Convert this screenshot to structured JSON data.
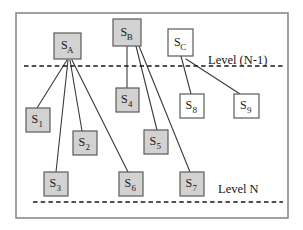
{
  "figure": {
    "title": "",
    "frame": {
      "x": 16,
      "y": 13,
      "width": 272,
      "height": 205,
      "border_color": "#8a8a8a"
    },
    "colors": {
      "filled_node_fill": "#d2d2d2",
      "open_node_fill": "#ffffff",
      "node_stroke": "#5a5a5a",
      "edge_color": "#3a3a3a",
      "level_line_color": "#1a1a1a",
      "text_color": "#1a1a1a"
    }
  },
  "level_lines": [
    {
      "id": "level-n-1-line",
      "y": 66,
      "x1": 24,
      "x2": 283,
      "style": "dashed"
    },
    {
      "id": "level-n-line",
      "y": 202,
      "x1": 33,
      "x2": 283,
      "style": "dashed"
    }
  ],
  "level_labels": [
    {
      "id": "level-n-1-label",
      "text": "Level (N-1)",
      "x": 208,
      "y": 64
    },
    {
      "id": "level-n-label",
      "text": "Level N",
      "x": 218,
      "y": 193
    }
  ],
  "nodes": [
    {
      "id": "node-sa",
      "base": "S",
      "sub": "A",
      "x": 54,
      "y": 33,
      "w": 27,
      "h": 26,
      "filled": true
    },
    {
      "id": "node-sb",
      "base": "S",
      "sub": "B",
      "x": 113,
      "y": 19,
      "w": 28,
      "h": 27,
      "filled": true
    },
    {
      "id": "node-sc",
      "base": "S",
      "sub": "C",
      "x": 168,
      "y": 29,
      "w": 25,
      "h": 27,
      "filled": false
    },
    {
      "id": "node-s1",
      "base": "S",
      "sub": "1",
      "x": 26,
      "y": 108,
      "w": 24,
      "h": 24,
      "filled": true
    },
    {
      "id": "node-s2",
      "base": "S",
      "sub": "2",
      "x": 73,
      "y": 131,
      "w": 24,
      "h": 24,
      "filled": true
    },
    {
      "id": "node-s3",
      "base": "S",
      "sub": "3",
      "x": 44,
      "y": 172,
      "w": 24,
      "h": 24,
      "filled": true
    },
    {
      "id": "node-s4",
      "base": "S",
      "sub": "4",
      "x": 116,
      "y": 88,
      "w": 23,
      "h": 24,
      "filled": true
    },
    {
      "id": "node-s5",
      "base": "S",
      "sub": "5",
      "x": 144,
      "y": 130,
      "w": 24,
      "h": 24,
      "filled": true
    },
    {
      "id": "node-s6",
      "base": "S",
      "sub": "6",
      "x": 119,
      "y": 172,
      "w": 24,
      "h": 24,
      "filled": true
    },
    {
      "id": "node-s7",
      "base": "S",
      "sub": "7",
      "x": 180,
      "y": 172,
      "w": 24,
      "h": 24,
      "filled": true
    },
    {
      "id": "node-s8",
      "base": "S",
      "sub": "8",
      "x": 180,
      "y": 94,
      "w": 24,
      "h": 24,
      "filled": false
    },
    {
      "id": "node-s9",
      "base": "S",
      "sub": "9",
      "x": 234,
      "y": 94,
      "w": 25,
      "h": 24,
      "filled": false
    }
  ],
  "edges": [
    {
      "id": "edge-sa-s1",
      "from": "node-sa",
      "to": "node-s1",
      "x1": 67,
      "y1": 60,
      "x2": 37,
      "y2": 108
    },
    {
      "id": "edge-sa-s3",
      "from": "node-sa",
      "to": "node-s3",
      "x1": 68,
      "y1": 60,
      "x2": 56,
      "y2": 172
    },
    {
      "id": "edge-sa-s2",
      "from": "node-sa",
      "to": "node-s2",
      "x1": 70,
      "y1": 60,
      "x2": 82,
      "y2": 131
    },
    {
      "id": "edge-sa-s6",
      "from": "node-sa",
      "to": "node-s6",
      "x1": 72,
      "y1": 60,
      "x2": 128,
      "y2": 172
    },
    {
      "id": "edge-sb-s4",
      "from": "node-sb",
      "to": "node-s4",
      "x1": 127,
      "y1": 46,
      "x2": 127,
      "y2": 88
    },
    {
      "id": "edge-sb-s5",
      "from": "node-sb",
      "to": "node-s5",
      "x1": 136,
      "y1": 46,
      "x2": 157,
      "y2": 130
    },
    {
      "id": "edge-sb-s7",
      "from": "node-sb",
      "to": "node-s7",
      "x1": 139,
      "y1": 46,
      "x2": 190,
      "y2": 172
    },
    {
      "id": "edge-sc-s8",
      "from": "node-sc",
      "to": "node-s8",
      "x1": 181,
      "y1": 56,
      "x2": 191,
      "y2": 94
    },
    {
      "id": "edge-sc-s9",
      "from": "node-sc",
      "to": "node-s9",
      "x1": 186,
      "y1": 59,
      "x2": 240,
      "y2": 94
    }
  ]
}
